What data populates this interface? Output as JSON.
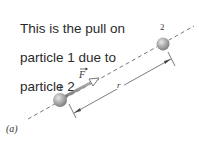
{
  "caption": {
    "lines": [
      "This is the pull on",
      "particle 1 due to",
      "particle 2."
    ]
  },
  "diagram": {
    "panel_label": "(a)",
    "particle_1": {
      "label": "1",
      "cx": 60,
      "cy": 100,
      "r": 7
    },
    "particle_2": {
      "label": "2",
      "cx": 163,
      "cy": 44,
      "r": 7
    },
    "force_vector": {
      "label": "F",
      "has_vector_arrow": true
    },
    "distance": {
      "label": "r"
    },
    "colors": {
      "particle": "#9a9a9a",
      "dashed_line": "#555555",
      "force_arrow": "#8a8a8a",
      "text": "#2a2a2a"
    }
  }
}
